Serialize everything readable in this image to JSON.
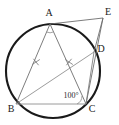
{
  "figure": {
    "kind": "circle-geometry-diagram",
    "canvas": {
      "width": 119,
      "height": 125,
      "background": "#ffffff"
    },
    "colors": {
      "circle_stroke": "#1a1a1a",
      "chord_stroke": "#6e6e6e",
      "thin_stroke": "#9a9a9a",
      "tick_stroke": "#7a7a7a",
      "label_text": "#1a1a1a",
      "angle_text": "#2a2a2a"
    },
    "circle": {
      "label": "circumscribed-circle",
      "center_x": 53,
      "center_y": 71,
      "radius": 47,
      "stroke_width": 2.1
    },
    "points": [
      {
        "id": "A",
        "label": "A",
        "x": 50,
        "y": 24,
        "label_x": 49,
        "label_y": 14,
        "on_circle": true
      },
      {
        "id": "B",
        "label": "B",
        "x": 16,
        "y": 104,
        "label_x": 11,
        "label_y": 110,
        "on_circle": true
      },
      {
        "id": "C",
        "label": "C",
        "x": 86,
        "y": 104,
        "label_x": 92,
        "label_y": 110,
        "on_circle": true
      },
      {
        "id": "D",
        "label": "D",
        "x": 94,
        "y": 52,
        "label_x": 101,
        "label_y": 50,
        "on_circle": true
      },
      {
        "id": "E",
        "label": "E",
        "x": 103,
        "y": 18,
        "label_x": 108,
        "label_y": 13,
        "on_circle": false
      }
    ],
    "segments": [
      {
        "id": "AB",
        "from": "A",
        "to": "B",
        "style": "chord",
        "width": 0.9
      },
      {
        "id": "AC",
        "from": "A",
        "to": "C",
        "style": "chord",
        "width": 0.9
      },
      {
        "id": "BC",
        "from": "B",
        "to": "C",
        "style": "thin",
        "width": 1.0
      },
      {
        "id": "BD",
        "from": "B",
        "to": "D",
        "style": "chord",
        "width": 0.9
      },
      {
        "id": "AE",
        "from": "A",
        "to": "E",
        "style": "chord",
        "width": 0.9
      },
      {
        "id": "EC",
        "from": "E",
        "to": "C",
        "style": "chord",
        "width": 0.9
      },
      {
        "id": "ED",
        "from": "E",
        "to": "D",
        "style": "chord",
        "width": 0.9
      },
      {
        "id": "DC",
        "from": "D",
        "to": "C",
        "style": "chord",
        "width": 0.9
      }
    ],
    "tick_marks": [
      {
        "id": "tick-AB",
        "on_segment": "AB",
        "x": 36,
        "y": 62,
        "count": 1,
        "note": "equal-length mark on AB"
      },
      {
        "id": "tick-AC",
        "on_segment": "AC",
        "x": 69,
        "y": 62,
        "count": 1,
        "note": "equal-length mark on AC"
      }
    ],
    "angle_marks": [
      {
        "id": "angle-A",
        "at": "A",
        "type": "arc",
        "label": "",
        "radius": 8
      },
      {
        "id": "angle-C",
        "at": "C",
        "type": "arc",
        "label": "100°",
        "radius": 9,
        "label_x": 71,
        "label_y": 96
      }
    ],
    "annotations": {
      "angle_at_c": "100°"
    }
  }
}
